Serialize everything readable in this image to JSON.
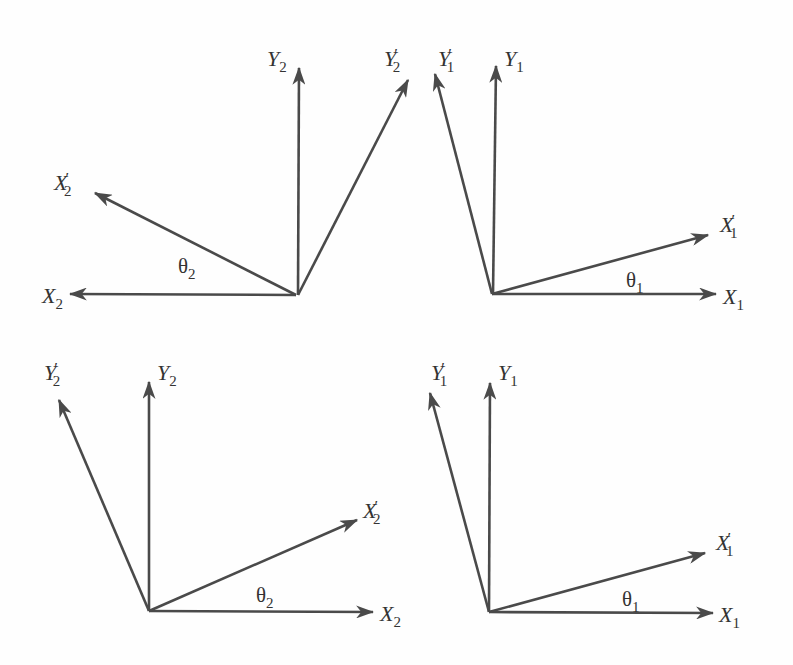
{
  "diagram": {
    "type": "coordinate-rotation",
    "colors": {
      "axis": "#4a4a4a",
      "text": "#333333",
      "background": "#fefefe"
    },
    "panels": [
      {
        "id": "top-left",
        "origin": [
          296,
          295
        ],
        "axes": [
          {
            "name": "X2",
            "tip": [
              70,
              294
            ],
            "label_main": "X",
            "label_prime": "",
            "label_sub": "2"
          },
          {
            "name": "X2'",
            "tip": [
              95,
              193
            ],
            "label_main": "X",
            "label_prime": "′",
            "label_sub": "2"
          },
          {
            "name": "Y2",
            "tip": [
              299,
              68
            ],
            "label_main": "Y",
            "label_prime": "",
            "label_sub": "2"
          },
          {
            "name": "Y2'",
            "tip": [
              408,
              80
            ],
            "label_main": "Y",
            "label_prime": "′",
            "label_sub": "2"
          }
        ],
        "angle": {
          "symbol": "θ",
          "sub": "2"
        }
      },
      {
        "id": "top-right",
        "origin": [
          492,
          294
        ],
        "axes": [
          {
            "name": "X1",
            "tip": [
              716,
              294
            ],
            "label_main": "X",
            "label_prime": "",
            "label_sub": "1"
          },
          {
            "name": "X1'",
            "tip": [
              708,
              235
            ],
            "label_main": "X",
            "label_prime": "′",
            "label_sub": "1"
          },
          {
            "name": "Y1",
            "tip": [
              496,
              66
            ],
            "label_main": "Y",
            "label_prime": "",
            "label_sub": "1"
          },
          {
            "name": "Y1'",
            "tip": [
              435,
              74
            ],
            "label_main": "Y",
            "label_prime": "′",
            "label_sub": "1"
          }
        ],
        "angle": {
          "symbol": "θ",
          "sub": "1"
        }
      },
      {
        "id": "bottom-left",
        "origin": [
          149,
          611
        ],
        "axes": [
          {
            "name": "X2",
            "tip": [
              373,
              612
            ],
            "label_main": "X",
            "label_prime": "",
            "label_sub": "2"
          },
          {
            "name": "X2'",
            "tip": [
              357,
              520
            ],
            "label_main": "X",
            "label_prime": "′",
            "label_sub": "2"
          },
          {
            "name": "Y2",
            "tip": [
              149,
              382
            ],
            "label_main": "Y",
            "label_prime": "",
            "label_sub": "2"
          },
          {
            "name": "Y2'",
            "tip": [
              59,
              400
            ],
            "label_main": "Y",
            "label_prime": "′",
            "label_sub": "2"
          }
        ],
        "angle": {
          "symbol": "θ",
          "sub": "2"
        }
      },
      {
        "id": "bottom-right",
        "origin": [
          489,
          612
        ],
        "axes": [
          {
            "name": "X1",
            "tip": [
              713,
              613
            ],
            "label_main": "X",
            "label_prime": "",
            "label_sub": "1"
          },
          {
            "name": "X1'",
            "tip": [
              705,
              553
            ],
            "label_main": "X",
            "label_prime": "′",
            "label_sub": "1"
          },
          {
            "name": "Y1",
            "tip": [
              490,
              383
            ],
            "label_main": "Y",
            "label_prime": "",
            "label_sub": "1"
          },
          {
            "name": "Y1'",
            "tip": [
              430,
              393
            ],
            "label_main": "Y",
            "label_prime": "′",
            "label_sub": "1"
          }
        ],
        "angle": {
          "symbol": "θ",
          "sub": "1"
        }
      }
    ]
  }
}
